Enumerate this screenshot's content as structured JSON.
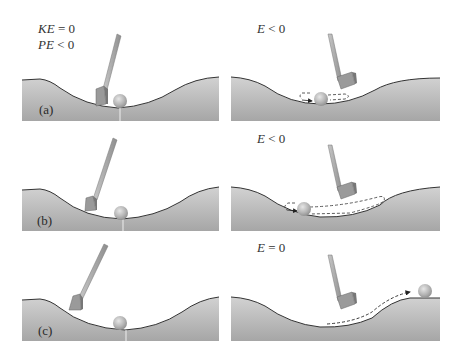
{
  "figure": {
    "rows": [
      {
        "label": "(a)",
        "left": {
          "lines": [
            "KE = 0",
            "PE < 0"
          ]
        },
        "right": {
          "lines": [
            "E < 0"
          ]
        }
      },
      {
        "label": "(b)",
        "left": {
          "lines": []
        },
        "right": {
          "lines": [
            "E < 0"
          ]
        }
      },
      {
        "label": "(c)",
        "left": {
          "lines": []
        },
        "right": {
          "lines": [
            "E = 0"
          ]
        }
      }
    ]
  },
  "colors": {
    "ground_top": "#c9c9c9",
    "ground_bottom": "#a8a8a8",
    "ground_edge": "#333333",
    "ball": "#b5b5b5",
    "club": "#9a9a9a"
  }
}
